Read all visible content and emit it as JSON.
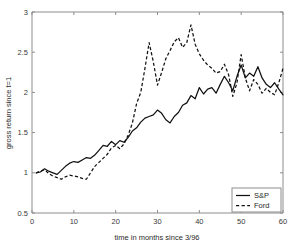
{
  "chart_data": {
    "type": "line",
    "title": "",
    "xlabel": "time in months since 3/96",
    "ylabel": "gross return since t=1",
    "xlim": [
      0,
      60
    ],
    "ylim": [
      0.5,
      3
    ],
    "xticks": [
      0,
      10,
      20,
      30,
      40,
      50,
      60
    ],
    "yticks": [
      0.5,
      1,
      1.5,
      2,
      2.5,
      3
    ],
    "ytick_labels": [
      "0.5",
      "1",
      "1.5",
      "2",
      "2.5",
      "3"
    ],
    "xtick_labels": [
      "0",
      "10",
      "20",
      "30",
      "40",
      "50",
      "60"
    ],
    "grid": false,
    "legend_position": "lower right",
    "line_color": "#111111",
    "axis_color": "#8d8d8d",
    "background": "#ffffff",
    "x": [
      1,
      2,
      3,
      4,
      5,
      6,
      7,
      8,
      9,
      10,
      11,
      12,
      13,
      14,
      15,
      16,
      17,
      18,
      19,
      20,
      21,
      22,
      23,
      24,
      25,
      26,
      27,
      28,
      29,
      30,
      31,
      32,
      33,
      34,
      35,
      36,
      37,
      38,
      39,
      40,
      41,
      42,
      43,
      44,
      45,
      46,
      47,
      48,
      49,
      50,
      51,
      52,
      53,
      54,
      55,
      56,
      57,
      58,
      59,
      60
    ],
    "series": [
      {
        "name": "S&P",
        "style": "solid",
        "values": [
          1.0,
          1.01,
          1.05,
          1.02,
          1.0,
          0.98,
          1.03,
          1.08,
          1.12,
          1.14,
          1.13,
          1.16,
          1.19,
          1.18,
          1.22,
          1.28,
          1.34,
          1.33,
          1.39,
          1.35,
          1.4,
          1.38,
          1.44,
          1.52,
          1.56,
          1.63,
          1.68,
          1.7,
          1.72,
          1.78,
          1.74,
          1.66,
          1.62,
          1.7,
          1.75,
          1.84,
          1.87,
          1.96,
          1.92,
          2.06,
          1.98,
          2.04,
          2.06,
          1.99,
          2.1,
          2.2,
          2.12,
          2.02,
          2.2,
          2.34,
          2.18,
          2.24,
          2.2,
          2.32,
          2.18,
          2.1,
          2.06,
          2.12,
          2.04,
          1.97
        ]
      },
      {
        "name": "Ford",
        "style": "dashed",
        "values": [
          1.0,
          1.02,
          1.04,
          0.99,
          0.96,
          0.94,
          0.92,
          0.95,
          0.97,
          0.96,
          0.95,
          0.93,
          0.92,
          1.0,
          1.08,
          1.13,
          1.18,
          1.23,
          1.31,
          1.34,
          1.3,
          1.36,
          1.47,
          1.62,
          1.86,
          2.0,
          2.3,
          2.62,
          2.38,
          2.09,
          2.25,
          2.42,
          2.52,
          2.63,
          2.68,
          2.56,
          2.62,
          2.84,
          2.6,
          2.48,
          2.4,
          2.34,
          2.3,
          2.24,
          2.26,
          2.35,
          2.22,
          1.95,
          2.12,
          2.47,
          2.18,
          2.02,
          2.16,
          2.1,
          1.99,
          2.05,
          2.0,
          1.97,
          2.12,
          2.3
        ]
      }
    ]
  },
  "legend": {
    "items": [
      {
        "label": "S&P",
        "style": "solid"
      },
      {
        "label": "Ford",
        "style": "dashed"
      }
    ]
  }
}
